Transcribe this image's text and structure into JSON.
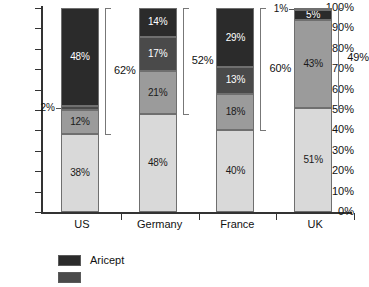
{
  "chart_data": {
    "type": "bar",
    "subtype": "stacked-100-percent",
    "title": "",
    "xlabel": "",
    "ylabel": "",
    "ylim": [
      0,
      100
    ],
    "grid": false,
    "legend_position": "bottom",
    "categories": [
      "US",
      "Germany",
      "France",
      "UK"
    ],
    "y_ticks": [
      "0%",
      "10%",
      "20%",
      "30%",
      "40%",
      "50%",
      "60%",
      "70%",
      "80%",
      "90%",
      "100%"
    ],
    "y_tick_values": [
      0,
      10,
      20,
      30,
      40,
      50,
      60,
      70,
      80,
      90,
      100
    ],
    "series": [
      {
        "name": "Aricept",
        "shade": "dark",
        "color": "#2b2b2b",
        "values": [
          48,
          14,
          29,
          5
        ]
      },
      {
        "name": "",
        "shade": "mid-dark",
        "color": "#4a4a4a",
        "values": [
          2,
          17,
          13,
          1
        ]
      },
      {
        "name": "",
        "shade": "mid",
        "color": "#9b9b9b",
        "values": [
          12,
          21,
          18,
          43
        ]
      },
      {
        "name": "",
        "shade": "light",
        "color": "#d9d9d9",
        "values": [
          38,
          48,
          40,
          51
        ]
      }
    ],
    "bars": [
      {
        "category": "US",
        "bracket": {
          "label": "62%",
          "from": 38,
          "to": 100
        },
        "segments": [
          {
            "value": 48,
            "label": "48%",
            "color": "#2b2b2b",
            "label_style": "inside-light",
            "from": 52,
            "to": 100
          },
          {
            "value": 2,
            "label": "2%",
            "color": "#4a4a4a",
            "label_style": "callout",
            "from": 50,
            "to": 52
          },
          {
            "value": 12,
            "label": "12%",
            "color": "#9b9b9b",
            "label_style": "inside-dark",
            "from": 38,
            "to": 50
          },
          {
            "value": 38,
            "label": "38%",
            "color": "#d9d9d9",
            "label_style": "inside-dark",
            "from": 0,
            "to": 38
          }
        ]
      },
      {
        "category": "Germany",
        "bracket": {
          "label": "52%",
          "from": 48,
          "to": 100
        },
        "segments": [
          {
            "value": 14,
            "label": "14%",
            "color": "#2b2b2b",
            "label_style": "inside-light",
            "from": 86,
            "to": 100
          },
          {
            "value": 17,
            "label": "17%",
            "color": "#4a4a4a",
            "label_style": "inside-light",
            "from": 69,
            "to": 86
          },
          {
            "value": 21,
            "label": "21%",
            "color": "#9b9b9b",
            "label_style": "inside-dark",
            "from": 48,
            "to": 69
          },
          {
            "value": 48,
            "label": "48%",
            "color": "#d9d9d9",
            "label_style": "inside-dark",
            "from": 0,
            "to": 48
          }
        ]
      },
      {
        "category": "France",
        "bracket": {
          "label": "60%",
          "from": 40,
          "to": 100
        },
        "segments": [
          {
            "value": 29,
            "label": "29%",
            "color": "#2b2b2b",
            "label_style": "inside-light",
            "from": 71,
            "to": 100
          },
          {
            "value": 13,
            "label": "13%",
            "color": "#4a4a4a",
            "label_style": "inside-light",
            "from": 58,
            "to": 71
          },
          {
            "value": 18,
            "label": "18%",
            "color": "#9b9b9b",
            "label_style": "inside-dark",
            "from": 40,
            "to": 58
          },
          {
            "value": 40,
            "label": "40%",
            "color": "#d9d9d9",
            "label_style": "inside-dark",
            "from": 0,
            "to": 40
          }
        ]
      },
      {
        "category": "UK",
        "bracket": {
          "label": "49%",
          "from": 51,
          "to": 100
        },
        "segments": [
          {
            "value": 1,
            "label": "1%",
            "color": "#4a4a4a",
            "label_style": "callout",
            "from": 99,
            "to": 100
          },
          {
            "value": 5,
            "label": "5%",
            "color": "#2b2b2b",
            "label_style": "inside-light",
            "from": 94,
            "to": 99
          },
          {
            "value": 43,
            "label": "43%",
            "color": "#9b9b9b",
            "label_style": "inside-dark",
            "from": 51,
            "to": 94
          },
          {
            "value": 51,
            "label": "51%",
            "color": "#d9d9d9",
            "label_style": "inside-dark",
            "from": 0,
            "to": 51
          }
        ]
      }
    ],
    "legend": [
      {
        "label": "Aricept",
        "color": "#2b2b2b"
      },
      {
        "label": "",
        "color": "#4a4a4a"
      }
    ]
  }
}
